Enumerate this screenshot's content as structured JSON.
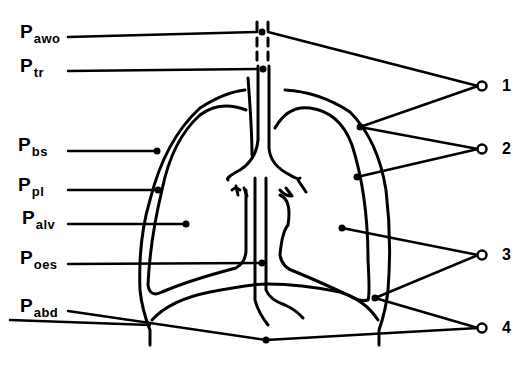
{
  "diagram": {
    "title": "",
    "line_color": "#000000",
    "background": "#ffffff",
    "pressure_labels": [
      {
        "main": "P",
        "sub": "awo",
        "meaning": "airway opening"
      },
      {
        "main": "P",
        "sub": "tr",
        "meaning": "trachea"
      },
      {
        "main": "P",
        "sub": "bs",
        "meaning": "body surface"
      },
      {
        "main": "P",
        "sub": "pl",
        "meaning": "pleural"
      },
      {
        "main": "P",
        "sub": "alv",
        "meaning": "alveolar"
      },
      {
        "main": "P",
        "sub": "oes",
        "meaning": "oesophageal"
      },
      {
        "main": "P",
        "sub": "abd",
        "meaning": "abdominal"
      }
    ],
    "numbered_nodes": [
      {
        "label": "1"
      },
      {
        "label": "2"
      },
      {
        "label": "3"
      },
      {
        "label": "4"
      }
    ]
  }
}
